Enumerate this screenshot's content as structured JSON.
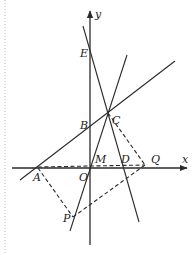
{
  "diagram": {
    "type": "coordinate-geometry",
    "axes": {
      "x_label": "x",
      "y_label": "y",
      "origin_label": "O"
    },
    "points": [
      {
        "name": "E",
        "label": "E"
      },
      {
        "name": "B",
        "label": "B"
      },
      {
        "name": "C",
        "label": "C"
      },
      {
        "name": "M",
        "label": "M"
      },
      {
        "name": "D",
        "label": "D"
      },
      {
        "name": "Q",
        "label": "Q"
      },
      {
        "name": "A",
        "label": "A"
      },
      {
        "name": "O",
        "label": "O"
      },
      {
        "name": "P",
        "label": "P"
      }
    ],
    "solid_lines": [
      "AB (through A, B)",
      "EC (through E, C, D)",
      "PC (through P, C)"
    ],
    "dashed_segments": [
      "AP",
      "PQ",
      "CQ",
      "AQ (through M)"
    ]
  }
}
